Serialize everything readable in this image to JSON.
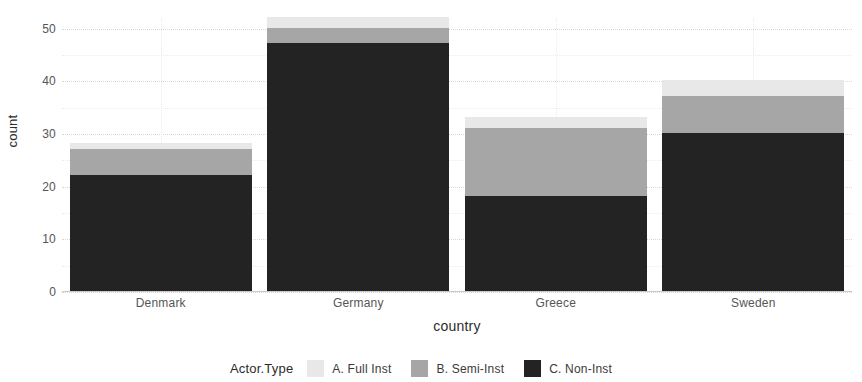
{
  "chart_data": {
    "type": "bar",
    "title": "",
    "subtitle": "",
    "xlabel": "country",
    "ylabel": "count",
    "stacked": true,
    "grid": true,
    "legend_position": "bottom",
    "legend_title": "Actor.Type",
    "categories": [
      "Denmark",
      "Germany",
      "Greece",
      "Sweden"
    ],
    "ylim": [
      0,
      52
    ],
    "yticks": [
      0,
      10,
      20,
      30,
      40,
      50
    ],
    "ytick_labels": [
      "0",
      "10",
      "20",
      "30",
      "40",
      "50"
    ],
    "series": [
      {
        "name": "A. Full Inst",
        "color": "#e8e8e8",
        "values": [
          1,
          2,
          2,
          3
        ]
      },
      {
        "name": "B. Semi-Inst",
        "color": "#a6a6a6",
        "values": [
          5,
          3,
          13,
          7
        ]
      },
      {
        "name": "C. Non-Inst",
        "color": "#232323",
        "values": [
          22,
          47,
          18,
          30
        ]
      }
    ],
    "totals": [
      28,
      52,
      33,
      40
    ],
    "panel_background": "#ffffff",
    "gridline_color": "#d8d8d8",
    "axis_text_color": "#555555"
  }
}
